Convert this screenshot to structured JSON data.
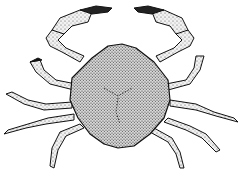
{
  "image": {
    "subject": "crab",
    "style": "stippled black and white illustration",
    "background_color": "#ffffff",
    "ink_color": "#111111",
    "fill_color": "#e6e6e6"
  }
}
